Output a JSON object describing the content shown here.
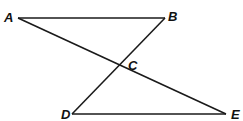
{
  "diagram": {
    "type": "geometry",
    "stroke_color": "#1a1a1a",
    "points": {
      "A": {
        "label": "A",
        "x": 18,
        "y": 18
      },
      "B": {
        "label": "B",
        "x": 165,
        "y": 18
      },
      "C": {
        "label": "C",
        "x": 119,
        "y": 65
      },
      "D": {
        "label": "D",
        "x": 72,
        "y": 114
      },
      "E": {
        "label": "E",
        "x": 226,
        "y": 114
      }
    },
    "segments": [
      "AB",
      "AE",
      "BD",
      "DE"
    ],
    "labels": {
      "A": "A",
      "B": "B",
      "C": "C",
      "D": "D",
      "E": "E"
    }
  }
}
